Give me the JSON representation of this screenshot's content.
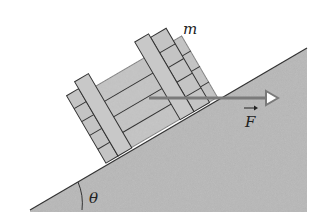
{
  "diagram": {
    "type": "physics-free-body",
    "labels": {
      "mass": "m",
      "force": "F",
      "angle": "θ"
    },
    "colors": {
      "incline_fill": "#b8b8b8",
      "crate_fill": "#c4c4c4",
      "outline": "#333333",
      "force_arrow": "#7a7a7a",
      "background": "#ffffff"
    },
    "incline": {
      "angle_label": "θ",
      "points": [
        [
          30,
          210
        ],
        [
          307,
          48
        ],
        [
          307,
          212
        ]
      ]
    },
    "force": {
      "direction": "horizontal",
      "vector_notation": true
    }
  }
}
